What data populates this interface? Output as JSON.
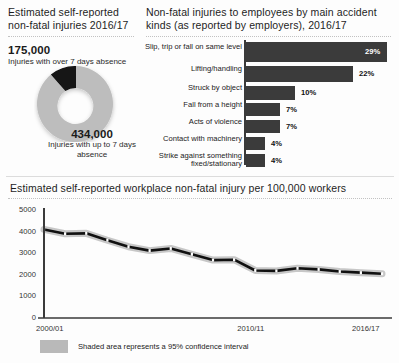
{
  "donut_panel": {
    "title": "Estimated self-reported non-fatal injuries 2016/17",
    "stat_over7_value": "175,000",
    "stat_over7_label": "Injuries with over 7 days absence",
    "stat_upto7_value": "434,000",
    "stat_upto7_label": "Injuries with up to 7 days absence"
  },
  "bar_panel": {
    "title": "Non-fatal injuries to employees by main accident kinds (as reported by employers), 2016/17"
  },
  "line_panel": {
    "title": "Estimated self-reported workplace non-fatal injury per 100,000 workers",
    "legend_text": "Shaded area represents a 95% confidence interval"
  },
  "chart_data": [
    {
      "type": "pie",
      "title": "Estimated self-reported non-fatal injuries 2016/17",
      "labels": [
        "Injuries with over 7 days absence",
        "Injuries with up to 7 days absence"
      ],
      "values": [
        175000,
        434000
      ],
      "value_labels": [
        "175,000",
        "434,000"
      ],
      "colors": [
        "#121212",
        "#bdbdbd"
      ],
      "legend": "none"
    },
    {
      "type": "bar",
      "orientation": "horizontal",
      "title": "Non-fatal injuries to employees by main accident kinds (as reported by employers), 2016/17",
      "categories": [
        "Slip, trip or fall on same level",
        "Lifting/handling",
        "Struck by object",
        "Fall from a height",
        "Acts of violence",
        "Contact with machinery",
        "Strike against something fixed/stationary"
      ],
      "values": [
        29,
        22,
        10,
        7,
        7,
        4,
        4
      ],
      "value_labels": [
        "29%",
        "22%",
        "10%",
        "7%",
        "7%",
        "4%",
        "4%"
      ],
      "xlabel": "",
      "ylabel": "",
      "xlim": [
        0,
        29
      ],
      "grid": false,
      "bar_color": "#3b3b3b"
    },
    {
      "type": "line",
      "title": "Estimated self-reported workplace non-fatal injury per 100,000 workers",
      "x": [
        "2000/01",
        "2001/02",
        "2002/03",
        "2003/04",
        "2004/05",
        "2005/06",
        "2006/07",
        "2007/08",
        "2008/09",
        "2009/10",
        "2010/11",
        "2011/12",
        "2012/13",
        "2013/14",
        "2014/15",
        "2015/16",
        "2016/17"
      ],
      "values": [
        4100,
        3900,
        3920,
        3600,
        3300,
        3120,
        3220,
        2950,
        2680,
        2700,
        2200,
        2180,
        2300,
        2250,
        2150,
        2100,
        2050
      ],
      "xlabel": "",
      "ylabel": "",
      "ylim": [
        0,
        5000
      ],
      "yticks": [
        0,
        1000,
        2000,
        3000,
        4000,
        5000
      ],
      "ytick_labels": [
        "0",
        "1000",
        "2000",
        "3000",
        "4000",
        "5000"
      ],
      "xtick_labels": [
        "2000/01",
        "2010/11",
        "2016/17"
      ],
      "grid": false,
      "line_color": "#111111",
      "band_color": "#bdbdbd",
      "annotation": "Shaded area represents a 95% confidence interval"
    }
  ]
}
